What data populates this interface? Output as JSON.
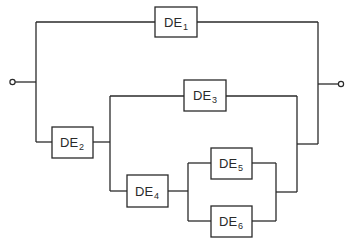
{
  "diagram": {
    "type": "reliability-block-diagram",
    "stroke_color": "#2a2a2a",
    "background": "#ffffff",
    "terminals": [
      {
        "id": "input",
        "label": ""
      },
      {
        "id": "output",
        "label": ""
      }
    ],
    "blocks": [
      {
        "id": "DE1",
        "base": "DE",
        "sub": "1"
      },
      {
        "id": "DE2",
        "base": "DE",
        "sub": "2"
      },
      {
        "id": "DE3",
        "base": "DE",
        "sub": "3"
      },
      {
        "id": "DE4",
        "base": "DE",
        "sub": "4"
      },
      {
        "id": "DE5",
        "base": "DE",
        "sub": "5"
      },
      {
        "id": "DE6",
        "base": "DE",
        "sub": "6"
      }
    ],
    "structure": "DE1 in parallel with [DE2 in series with (DE3 in parallel with [DE4 in series with (DE5 parallel DE6)])]"
  }
}
